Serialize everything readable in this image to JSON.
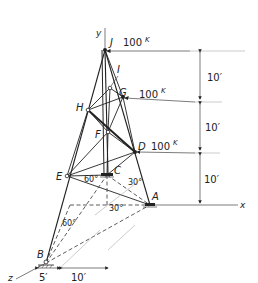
{
  "diagram": {
    "type": "space-truss",
    "axes": {
      "x": "x",
      "y": "y",
      "z": "z"
    },
    "nodes": [
      {
        "id": "J",
        "label": "J"
      },
      {
        "id": "I",
        "label": "I"
      },
      {
        "id": "G",
        "label": "G"
      },
      {
        "id": "H",
        "label": "H"
      },
      {
        "id": "F",
        "label": "F"
      },
      {
        "id": "D",
        "label": "D"
      },
      {
        "id": "E",
        "label": "E"
      },
      {
        "id": "C",
        "label": "C"
      },
      {
        "id": "A",
        "label": "A"
      },
      {
        "id": "B",
        "label": "B"
      }
    ],
    "loads": [
      {
        "node": "J",
        "label": "100",
        "unit": "K"
      },
      {
        "node": "G",
        "label": "100",
        "unit": "K"
      },
      {
        "node": "D",
        "label": "100",
        "unit": "K"
      }
    ],
    "vertical_dimensions": [
      "10′",
      "10′",
      "10′"
    ],
    "base_dimensions": [
      "5′",
      "10′"
    ],
    "angles": [
      "60°",
      "30°",
      "30°",
      "60°"
    ]
  }
}
